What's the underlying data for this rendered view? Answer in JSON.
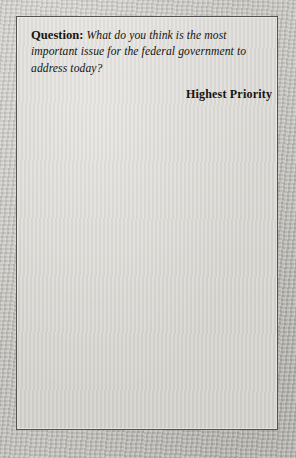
{
  "question": {
    "label": "Question:",
    "text": "What do you think is the most important issue for the federal government to address today?"
  },
  "header": "Highest Priority",
  "chart_data": {
    "type": "bar",
    "orientation": "horizontal",
    "title": "Highest Priority",
    "subtitle": "Question: What do you think is the most important issue for the federal government to address today?",
    "xlabel": "",
    "ylabel": "",
    "xlim": [
      0,
      38
    ],
    "grid": false,
    "legend": "none",
    "value_suffix": "%",
    "categories": [
      "Economy/Jobs/ Unemployment",
      "Terrorism, other than Iraq",
      "Defense/Military/ Homeland security",
      "Education",
      "Health care/ Prescription drugs",
      "War/Iraq/Saddam Hussein",
      "Domestic issues/ Take care of U.S.",
      "Balanced budget/Deficit",
      "Taxes",
      "Social Security/ Medicare",
      "Other",
      "Don't know"
    ],
    "values": [
      38,
      14,
      8,
      7,
      7,
      6,
      3,
      3,
      2,
      2,
      5,
      5
    ],
    "bars": [
      {
        "line1": "Economy/Jobs/",
        "line2": "Unemployment",
        "value": 38,
        "value_label": "38%",
        "label_position": "inside",
        "row_height": 30
      },
      {
        "line1": "Terrorism, other than Iraq",
        "line2": "",
        "value": 14,
        "value_label": "14%",
        "label_position": "inside",
        "row_height": 30
      },
      {
        "line1": "Defense/Military/",
        "line2": "Homeland security",
        "value": 8,
        "value_label": "8%",
        "label_position": "inside",
        "row_height": 30
      },
      {
        "line1": "Education",
        "line2": "",
        "value": 7,
        "value_label": "7%",
        "label_position": "inside",
        "row_height": 26
      },
      {
        "line1": "Health care/",
        "line2": "Prescription drugs",
        "value": 7,
        "value_label": "7%",
        "label_position": "inside",
        "row_height": 30
      },
      {
        "line1": "War/Iraq/Saddam Hussein",
        "line2": "",
        "value": 6,
        "value_label": "6%",
        "label_position": "inside",
        "row_height": 26
      },
      {
        "line1": "Domestic issues/",
        "line2": "Take care of U.S.",
        "value": 3,
        "value_label": "3%",
        "label_position": "outside",
        "row_height": 30
      },
      {
        "line1": "Balanced budget/Deficit",
        "line2": "",
        "value": 3,
        "value_label": "3%",
        "label_position": "outside",
        "row_height": 28
      },
      {
        "line1": "Taxes",
        "line2": "",
        "value": 2,
        "value_label": "2%",
        "label_position": "outside",
        "row_height": 26
      },
      {
        "line1": "Social Security/ Medicare",
        "line2": "",
        "value": 2,
        "value_label": "2%",
        "label_position": "outside",
        "row_height": 28
      },
      {
        "line1": "Other",
        "line2": "",
        "value": 5,
        "value_label": "5%",
        "label_position": "outside",
        "row_height": 28
      },
      {
        "line1": "Don't know",
        "line2": "",
        "value": 5,
        "value_label": "5%",
        "label_position": "outside",
        "row_height": 30
      }
    ]
  },
  "colors": {
    "panel_bg": "#d9d7d3",
    "panel_border": "#55534f",
    "bar_light": "#ecebe7",
    "bar_dark": "#8d8d8a",
    "bar_border": "#6d6b66",
    "text": "#17160f",
    "page_bg": "#c9c7c2"
  },
  "scale": {
    "baseline_x_px": 148,
    "px_per_percent": 3.21
  }
}
